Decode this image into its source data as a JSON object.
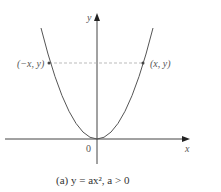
{
  "diagram": {
    "type": "parabola-graph",
    "axes": {
      "x_label": "x",
      "y_label": "y",
      "origin_label": "0"
    },
    "points": [
      {
        "label": "(−x, y)",
        "side": "left"
      },
      {
        "label": "(x, y)",
        "side": "right"
      }
    ],
    "caption": "(a) y = ax², a > 0",
    "colors": {
      "curve": "#555555",
      "axes": "#444444",
      "dashed": "#aaaaaa"
    }
  }
}
